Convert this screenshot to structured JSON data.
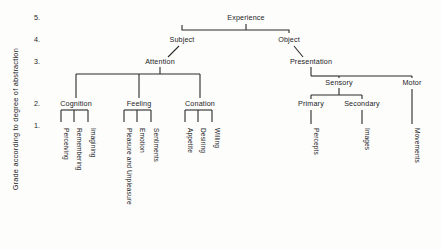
{
  "diagram": {
    "axis_label": "Grade according to degree of abstraction",
    "levels": [
      {
        "num": "5.",
        "y": 18
      },
      {
        "num": "4.",
        "y": 40
      },
      {
        "num": "3.",
        "y": 62
      },
      {
        "num": "2.",
        "y": 104
      },
      {
        "num": "1.",
        "y": 126
      }
    ],
    "nodes": [
      {
        "id": "experience",
        "label": "Experience",
        "x": 246,
        "y": 18
      },
      {
        "id": "subject",
        "label": "Subject",
        "x": 182,
        "y": 40
      },
      {
        "id": "object",
        "label": "Object",
        "x": 289,
        "y": 40
      },
      {
        "id": "attention",
        "label": "Attention",
        "x": 160,
        "y": 62
      },
      {
        "id": "presentation",
        "label": "Presentation",
        "x": 311,
        "y": 62
      },
      {
        "id": "sensory",
        "label": "Sensory",
        "x": 339,
        "y": 83
      },
      {
        "id": "motor",
        "label": "Motor",
        "x": 412,
        "y": 83
      },
      {
        "id": "cognition",
        "label": "Cognition",
        "x": 76,
        "y": 104
      },
      {
        "id": "feeling",
        "label": "Feeling",
        "x": 139,
        "y": 104
      },
      {
        "id": "conation",
        "label": "Conation",
        "x": 200,
        "y": 104
      },
      {
        "id": "primary",
        "label": "Primary",
        "x": 311,
        "y": 104
      },
      {
        "id": "secondary",
        "label": "Secondary",
        "x": 362,
        "y": 104
      }
    ],
    "leaves": [
      {
        "id": "perceiving",
        "label": "Perceiving",
        "x": 61,
        "y": 128
      },
      {
        "id": "remembering",
        "label": "Remembering",
        "x": 74,
        "y": 128
      },
      {
        "id": "imagining",
        "label": "Imagining",
        "x": 88,
        "y": 128
      },
      {
        "id": "pleasure",
        "label": "Pleasure and Unpleasure",
        "x": 124,
        "y": 128
      },
      {
        "id": "emotion",
        "label": "Emotion",
        "x": 137,
        "y": 128
      },
      {
        "id": "sentiments",
        "label": "Sentiments",
        "x": 151,
        "y": 128
      },
      {
        "id": "appetite",
        "label": "Appetite",
        "x": 185,
        "y": 128
      },
      {
        "id": "desiring",
        "label": "Desiring",
        "x": 198,
        "y": 128
      },
      {
        "id": "willing",
        "label": "Willing",
        "x": 212,
        "y": 128
      },
      {
        "id": "percepts",
        "label": "Percepts",
        "x": 311,
        "y": 128
      },
      {
        "id": "images",
        "label": "Images",
        "x": 362,
        "y": 128
      },
      {
        "id": "movements",
        "label": "Movements",
        "x": 412,
        "y": 128
      }
    ],
    "line_color": "#2a2a2a"
  }
}
